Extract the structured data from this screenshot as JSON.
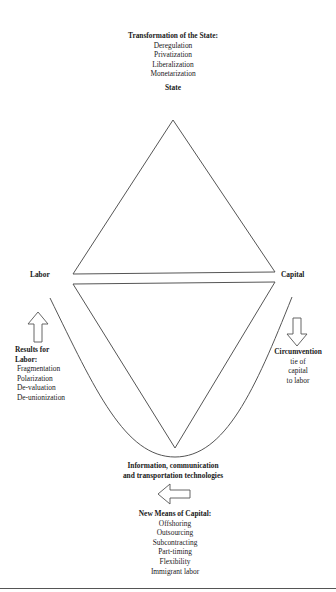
{
  "diagram": {
    "top_block": {
      "title": "Transformation of the State:",
      "items": [
        "Deregulation",
        "Privatization",
        "Liberalization",
        "Monetarization"
      ]
    },
    "nodes": {
      "state": "State",
      "labor": "Labor",
      "capital": "Capital"
    },
    "left_block": {
      "title_line1": "Results for",
      "title_line2": "Labor:",
      "items": [
        "Fragmentation",
        "Polarization",
        "De-valuation",
        "De-unionization"
      ],
      "arrow": "up-arrow"
    },
    "right_block": {
      "title": "Circumvention",
      "lines": [
        "tie of",
        "capital",
        "to labor"
      ],
      "arrow": "down-arrow"
    },
    "bottom_center": {
      "line1": "Information, communication",
      "line2": "and transportation technologies",
      "arrow": "left-arrow"
    },
    "bottom_block": {
      "title": "New Means of Capital:",
      "items": [
        "Offshoring",
        "Outsourcing",
        "Subcontracting",
        "Part-timing",
        "Flexibility",
        "Immigrant labor"
      ]
    },
    "colors": {
      "line": "#555555",
      "text": "#1a1a1a",
      "background": "#ffffff"
    }
  }
}
